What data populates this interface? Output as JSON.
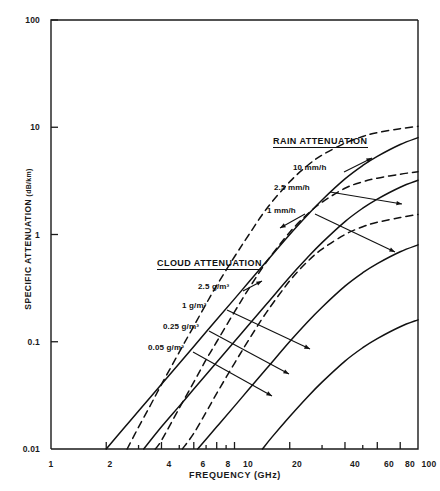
{
  "chart_data": {
    "type": "line",
    "title": "",
    "xlabel": "FREQUENCY (GHz)",
    "ylabel": "SPECIFIC ATTENUATION",
    "ylabel_unit": "(dB/km)",
    "xscale": "log",
    "yscale": "log",
    "xlim": [
      1,
      100
    ],
    "ylim": [
      0.01,
      100
    ],
    "grid": false,
    "legend_position": "inline-annotations",
    "xticks": [
      {
        "value": 1,
        "label": "1"
      },
      {
        "value": 2,
        "label": "2"
      },
      {
        "value": 3,
        "label": ""
      },
      {
        "value": 4,
        "label": "4"
      },
      {
        "value": 5,
        "label": ""
      },
      {
        "value": 6,
        "label": "6"
      },
      {
        "value": 7,
        "label": ""
      },
      {
        "value": 8,
        "label": "8"
      },
      {
        "value": 9,
        "label": ""
      },
      {
        "value": 10,
        "label": "10"
      },
      {
        "value": 20,
        "label": "20"
      },
      {
        "value": 30,
        "label": ""
      },
      {
        "value": 40,
        "label": "40"
      },
      {
        "value": 50,
        "label": ""
      },
      {
        "value": 60,
        "label": "60"
      },
      {
        "value": 80,
        "label": "80"
      },
      {
        "value": 100,
        "label": "100"
      }
    ],
    "yticks": [
      {
        "value": 0.01,
        "label": "0.01"
      },
      {
        "value": 0.1,
        "label": "0.1"
      },
      {
        "value": 1,
        "label": "1"
      },
      {
        "value": 10,
        "label": "10"
      },
      {
        "value": 100,
        "label": "100"
      }
    ],
    "groups": [
      {
        "name": "RAIN ATTENUATION",
        "style": "dashed",
        "series": [
          {
            "name": "10 mm/h",
            "points": [
              [
                2.6,
                0.01
              ],
              [
                3.0,
                0.016
              ],
              [
                3.5,
                0.026
              ],
              [
                4.0,
                0.04
              ],
              [
                5.0,
                0.08
              ],
              [
                6.0,
                0.14
              ],
              [
                7.0,
                0.225
              ],
              [
                8.0,
                0.335
              ],
              [
                10.0,
                0.62
              ],
              [
                12.0,
                1.0
              ],
              [
                15.0,
                1.75
              ],
              [
                20.0,
                3.1
              ],
              [
                25.0,
                4.4
              ],
              [
                30.0,
                5.5
              ],
              [
                40.0,
                7.1
              ],
              [
                50.0,
                8.2
              ],
              [
                60.0,
                8.9
              ],
              [
                80.0,
                9.7
              ],
              [
                100.0,
                10.2
              ]
            ]
          },
          {
            "name": "2.5 mm/h",
            "points": [
              [
                3.7,
                0.01
              ],
              [
                4.0,
                0.012
              ],
              [
                5.0,
                0.024
              ],
              [
                6.0,
                0.042
              ],
              [
                7.0,
                0.068
              ],
              [
                8.0,
                0.1
              ],
              [
                10.0,
                0.19
              ],
              [
                12.0,
                0.315
              ],
              [
                15.0,
                0.56
              ],
              [
                20.0,
                1.05
              ],
              [
                25.0,
                1.55
              ],
              [
                30.0,
                2.0
              ],
              [
                40.0,
                2.7
              ],
              [
                50.0,
                3.1
              ],
              [
                60.0,
                3.35
              ],
              [
                80.0,
                3.65
              ],
              [
                100.0,
                3.85
              ]
            ]
          },
          {
            "name": "1 mm/h",
            "points": [
              [
                5.2,
                0.01
              ],
              [
                6.0,
                0.014
              ],
              [
                7.0,
                0.022
              ],
              [
                8.0,
                0.033
              ],
              [
                10.0,
                0.063
              ],
              [
                12.0,
                0.105
              ],
              [
                15.0,
                0.19
              ],
              [
                20.0,
                0.37
              ],
              [
                25.0,
                0.56
              ],
              [
                30.0,
                0.73
              ],
              [
                40.0,
                1.0
              ],
              [
                50.0,
                1.18
              ],
              [
                60.0,
                1.3
              ],
              [
                80.0,
                1.44
              ],
              [
                100.0,
                1.54
              ]
            ]
          }
        ]
      },
      {
        "name": "CLOUD ATTENUATION",
        "style": "solid",
        "series": [
          {
            "name": "2.5 g/m³",
            "points": [
              [
                2.0,
                0.01
              ],
              [
                2.5,
                0.0157
              ],
              [
                3.0,
                0.0226
              ],
              [
                4.0,
                0.0402
              ],
              [
                5.0,
                0.0628
              ],
              [
                6.0,
                0.0905
              ],
              [
                8.0,
                0.161
              ],
              [
                10.0,
                0.251
              ],
              [
                12.0,
                0.362
              ],
              [
                15.0,
                0.565
              ],
              [
                20.0,
                1.0
              ],
              [
                25.0,
                1.52
              ],
              [
                30.0,
                2.1
              ],
              [
                40.0,
                3.3
              ],
              [
                50.0,
                4.4
              ],
              [
                60.0,
                5.35
              ],
              [
                80.0,
                6.9
              ],
              [
                100.0,
                8.0
              ]
            ]
          },
          {
            "name": "1 g/m³",
            "points": [
              [
                3.2,
                0.01
              ],
              [
                4.0,
                0.0161
              ],
              [
                5.0,
                0.0251
              ],
              [
                6.0,
                0.0362
              ],
              [
                8.0,
                0.0644
              ],
              [
                10.0,
                0.1005
              ],
              [
                12.0,
                0.145
              ],
              [
                15.0,
                0.226
              ],
              [
                20.0,
                0.402
              ],
              [
                25.0,
                0.61
              ],
              [
                30.0,
                0.84
              ],
              [
                40.0,
                1.32
              ],
              [
                50.0,
                1.76
              ],
              [
                60.0,
                2.14
              ],
              [
                80.0,
                2.76
              ],
              [
                100.0,
                3.2
              ]
            ]
          },
          {
            "name": "0.25 g/m³",
            "points": [
              [
                6.3,
                0.01
              ],
              [
                8.0,
                0.0161
              ],
              [
                10.0,
                0.0251
              ],
              [
                12.0,
                0.0362
              ],
              [
                15.0,
                0.0565
              ],
              [
                20.0,
                0.1005
              ],
              [
                25.0,
                0.153
              ],
              [
                30.0,
                0.21
              ],
              [
                40.0,
                0.33
              ],
              [
                50.0,
                0.44
              ],
              [
                60.0,
                0.535
              ],
              [
                80.0,
                0.69
              ],
              [
                100.0,
                0.8
              ]
            ]
          },
          {
            "name": "0.05 g/m³",
            "points": [
              [
                14.2,
                0.01
              ],
              [
                16.0,
                0.0129
              ],
              [
                20.0,
                0.0201
              ],
              [
                25.0,
                0.0306
              ],
              [
                30.0,
                0.042
              ],
              [
                40.0,
                0.066
              ],
              [
                50.0,
                0.088
              ],
              [
                60.0,
                0.107
              ],
              [
                80.0,
                0.138
              ],
              [
                100.0,
                0.16
              ]
            ]
          }
        ]
      }
    ],
    "annotations": [
      {
        "text": "RAIN ATTENUATION",
        "kind": "group-heading"
      },
      {
        "text": "10 mm/h",
        "kind": "series-callout"
      },
      {
        "text": "2.5 mm/h",
        "kind": "series-callout"
      },
      {
        "text": "1 mm/h",
        "kind": "series-callout"
      },
      {
        "text": "CLOUD ATTENUATION",
        "kind": "group-heading"
      },
      {
        "text": "2.5 g/m³",
        "kind": "series-callout"
      },
      {
        "text": "1 g/m³",
        "kind": "series-callout"
      },
      {
        "text": "0.25 g/m³",
        "kind": "series-callout"
      },
      {
        "text": "0.05 g/m³",
        "kind": "series-callout"
      }
    ],
    "colors": {
      "axis": "#1a1a1a",
      "curve": "#111111",
      "background": "#ffffff"
    }
  },
  "labels": {
    "rain_group": "RAIN ATTENUATION",
    "rain_10": "10 mm/h",
    "rain_25": "2.5 mm/h",
    "rain_1": "1 mm/h",
    "cloud_group": "CLOUD ATTENUATION",
    "cloud_25": "2.5 g/m³",
    "cloud_1": "1 g/m³",
    "cloud_025": "0.25 g/m³",
    "cloud_005": "0.05 g/m³",
    "xaxis_title": "FREQUENCY (GHz)",
    "yaxis_title": "SPECIFIC ATTENUATION",
    "yaxis_unit": "(dB/km)"
  }
}
